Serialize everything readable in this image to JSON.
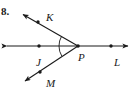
{
  "figure": {
    "problem_number": "8.",
    "background_color": "#ffffff",
    "stroke_color": "#1a1a1a",
    "width": 135,
    "height": 97,
    "points": [
      {
        "name": "K",
        "label": "K",
        "dot_x": 38,
        "dot_y": 22,
        "label_x": 46,
        "label_y": 12
      },
      {
        "name": "J",
        "label": "J",
        "dot_x": 39,
        "dot_y": 46,
        "label_x": 36,
        "label_y": 57
      },
      {
        "name": "P",
        "label": "P",
        "dot_x": 78,
        "dot_y": 46,
        "label_x": 78,
        "label_y": 52
      },
      {
        "name": "L",
        "label": "L",
        "dot_x": 111,
        "dot_y": 46,
        "label_x": 114,
        "label_y": 57
      },
      {
        "name": "M",
        "label": "M",
        "dot_x": 40,
        "dot_y": 72,
        "label_x": 46,
        "label_y": 78
      }
    ],
    "lines": [
      {
        "name": "line-JL",
        "kind": "double-arrow-line",
        "x1": 6,
        "y1": 46,
        "x2": 129,
        "y2": 46
      },
      {
        "name": "ray-PK",
        "kind": "single-arrow-ray",
        "x1": 78,
        "y1": 46,
        "x2": 22,
        "y2": 14
      },
      {
        "name": "ray-PM",
        "kind": "single-arrow-ray",
        "x1": 78,
        "y1": 46,
        "x2": 24,
        "y2": 82
      }
    ],
    "angle_marks": [
      {
        "name": "angle-KPJ",
        "radius": 17
      },
      {
        "name": "angle-JPM",
        "radius": 17
      }
    ]
  }
}
